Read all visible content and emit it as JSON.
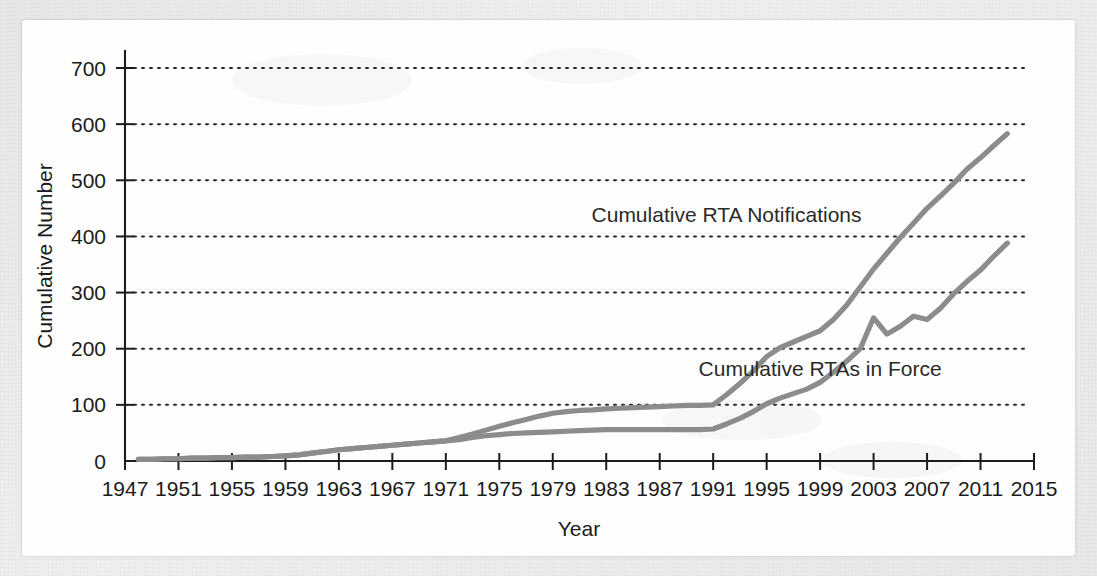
{
  "figure": {
    "background_color": "#fefefe",
    "page_color": "#ececed",
    "line_color": "#8c8c8c",
    "axis_color": "#1c1c1c"
  },
  "chart_data": {
    "type": "line",
    "title": "",
    "xlabel": "Year",
    "ylabel": "Cumulative Number",
    "xlim": [
      1947,
      2015
    ],
    "ylim": [
      0,
      700
    ],
    "grid": true,
    "grid_orientation": "horizontal",
    "legend_position": "inline-annotation",
    "x_ticks": [
      1947,
      1951,
      1955,
      1959,
      1963,
      1967,
      1971,
      1975,
      1979,
      1983,
      1987,
      1991,
      1995,
      1999,
      2003,
      2007,
      2011,
      2015
    ],
    "x_tick_labels": [
      "1947",
      "1951",
      "1955",
      "1959",
      "1963",
      "1967",
      "1971",
      "1975",
      "1979",
      "1983",
      "1987",
      "1991",
      "1995",
      "1999",
      "2003",
      "2007",
      "2011",
      "2015"
    ],
    "y_ticks": [
      0,
      100,
      200,
      300,
      400,
      500,
      600,
      700
    ],
    "y_tick_labels": [
      "0",
      "100",
      "200",
      "300",
      "400",
      "500",
      "600",
      "700"
    ],
    "x": [
      1948,
      1949,
      1950,
      1951,
      1952,
      1953,
      1954,
      1955,
      1956,
      1957,
      1958,
      1959,
      1960,
      1961,
      1962,
      1963,
      1964,
      1965,
      1966,
      1967,
      1968,
      1969,
      1970,
      1971,
      1972,
      1973,
      1974,
      1975,
      1976,
      1977,
      1978,
      1979,
      1980,
      1981,
      1982,
      1983,
      1984,
      1985,
      1986,
      1987,
      1988,
      1989,
      1990,
      1991,
      1992,
      1993,
      1994,
      1995,
      1996,
      1997,
      1998,
      1999,
      2000,
      2001,
      2002,
      2003,
      2004,
      2005,
      2006,
      2007,
      2008,
      2009,
      2010,
      2011,
      2012,
      2013
    ],
    "series": [
      {
        "name": "Cumulative RTA Notifications",
        "label": "Cumulative RTA Notifications",
        "color": "#8c8c8c",
        "values": [
          3,
          3,
          4,
          4,
          5,
          5,
          6,
          6,
          7,
          7,
          8,
          9,
          11,
          14,
          17,
          20,
          22,
          24,
          26,
          28,
          30,
          32,
          34,
          36,
          42,
          48,
          55,
          62,
          68,
          74,
          80,
          85,
          88,
          90,
          91,
          93,
          94,
          95,
          96,
          97,
          98,
          99,
          99,
          100,
          118,
          138,
          160,
          186,
          202,
          212,
          222,
          232,
          252,
          278,
          310,
          342,
          370,
          398,
          424,
          450,
          472,
          495,
          520,
          540,
          562,
          583
        ]
      },
      {
        "name": "Cumulative RTAs in Force",
        "label": "Cumulative RTAs in Force",
        "color": "#8c8c8c",
        "values": [
          3,
          3,
          4,
          4,
          5,
          5,
          6,
          6,
          7,
          7,
          8,
          9,
          11,
          14,
          17,
          20,
          22,
          24,
          26,
          28,
          30,
          32,
          34,
          36,
          38,
          42,
          45,
          47,
          49,
          50,
          51,
          52,
          53,
          54,
          55,
          56,
          56,
          56,
          56,
          56,
          56,
          56,
          56,
          57,
          66,
          76,
          88,
          102,
          112,
          120,
          128,
          140,
          158,
          178,
          200,
          255,
          226,
          240,
          258,
          252,
          272,
          298,
          320,
          340,
          365,
          388
        ]
      }
    ],
    "annotations": [
      {
        "text": "Cumulative RTA Notifications",
        "x": 1992,
        "y": 425
      },
      {
        "text": "Cumulative RTAs in Force",
        "x": 1999,
        "y": 152
      }
    ]
  }
}
